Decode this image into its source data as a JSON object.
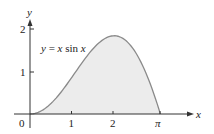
{
  "chart_data": {
    "type": "area",
    "title": "",
    "function_label": "y = x sin x",
    "xlabel": "x",
    "ylabel": "y",
    "x_ticks": [
      "0",
      "1",
      "2",
      "π"
    ],
    "y_ticks": [
      "1",
      "2"
    ],
    "xlim": [
      0,
      3.1416
    ],
    "ylim": [
      0,
      2
    ],
    "x": [
      0,
      0.25,
      0.5,
      0.75,
      1.0,
      1.25,
      1.5,
      1.75,
      2.0,
      2.25,
      2.5,
      2.75,
      3.0,
      3.1416
    ],
    "values": [
      0,
      0.062,
      0.24,
      0.511,
      0.841,
      1.186,
      1.496,
      1.722,
      1.819,
      1.751,
      1.496,
      1.051,
      0.423,
      0
    ],
    "fill": "shaded region under curve from 0 to π",
    "grid": false,
    "colors": {
      "curve": "#8a8a8a",
      "fill": "#ececec",
      "axes": "#333333"
    }
  },
  "labels": {
    "origin": "0",
    "tick1": "1",
    "tick2": "2",
    "tickpi": "π",
    "ytick1": "1",
    "ytick2": "2",
    "xaxis": "x",
    "yaxis": "y",
    "eq_y": "y",
    "eq_mid": " = ",
    "eq_x": "x",
    "eq_sin": " sin ",
    "eq_x2": "x"
  }
}
